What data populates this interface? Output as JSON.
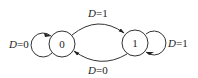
{
  "diagram": {
    "type": "state-transition",
    "states": [
      {
        "id": "s0",
        "label": "0"
      },
      {
        "id": "s1",
        "label": "1"
      }
    ],
    "transitions": [
      {
        "from": "0",
        "to": "0",
        "var": "D",
        "value": "0",
        "label": "D=0"
      },
      {
        "from": "0",
        "to": "1",
        "var": "D",
        "value": "1",
        "label": "D=1"
      },
      {
        "from": "1",
        "to": "1",
        "var": "D",
        "value": "1",
        "label": "D=1"
      },
      {
        "from": "1",
        "to": "0",
        "var": "D",
        "value": "0",
        "label": "D=0"
      }
    ],
    "labels": {
      "self_loop_0": {
        "var": "D",
        "eq": "=0"
      },
      "edge_0_to_1": {
        "var": "D",
        "eq": "=1"
      },
      "self_loop_1": {
        "var": "D",
        "eq": "=1"
      },
      "edge_1_to_0": {
        "var": "D",
        "eq": "=0"
      }
    },
    "colors": {
      "stroke": "#333333",
      "background": "#ffffff"
    }
  }
}
